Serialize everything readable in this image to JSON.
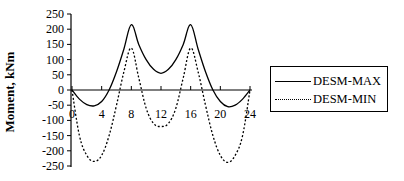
{
  "chart_data": {
    "type": "line",
    "title": "",
    "xlabel": "",
    "ylabel": "Moment, kNm",
    "xlim": [
      0,
      24
    ],
    "ylim": [
      -250,
      250
    ],
    "x_ticks": [
      0,
      4,
      8,
      12,
      16,
      20,
      24
    ],
    "y_ticks": [
      250,
      200,
      150,
      100,
      50,
      0,
      -50,
      -100,
      -150,
      -200,
      -250
    ],
    "grid": false,
    "legend_position": "right",
    "series": [
      {
        "name": "DESM-MAX",
        "style": "solid",
        "x": [
          0,
          1,
          2,
          3,
          4,
          5,
          6,
          7,
          8,
          9,
          10,
          11,
          12,
          13,
          14,
          15,
          16,
          17,
          18,
          19,
          20,
          21,
          22,
          23,
          24
        ],
        "y": [
          0,
          -30,
          -48,
          -52,
          -38,
          0,
          60,
          135,
          215,
          150,
          100,
          68,
          55,
          68,
          100,
          150,
          215,
          135,
          60,
          0,
          -38,
          -55,
          -50,
          -30,
          0
        ]
      },
      {
        "name": "DESM-MIN",
        "style": "dotted",
        "x": [
          0,
          1,
          2,
          3,
          4,
          5,
          6,
          7,
          8,
          9,
          10,
          11,
          12,
          13,
          14,
          15,
          16,
          17,
          18,
          19,
          20,
          21,
          22,
          23,
          24
        ],
        "y": [
          0,
          -150,
          -215,
          -235,
          -215,
          -150,
          -50,
          60,
          138,
          40,
          -60,
          -110,
          -120,
          -110,
          -60,
          40,
          138,
          60,
          -50,
          -150,
          -215,
          -238,
          -215,
          -150,
          0
        ]
      }
    ]
  },
  "legend": {
    "items": [
      {
        "label": "DESM-MAX"
      },
      {
        "label": "DESM-MIN"
      }
    ]
  }
}
